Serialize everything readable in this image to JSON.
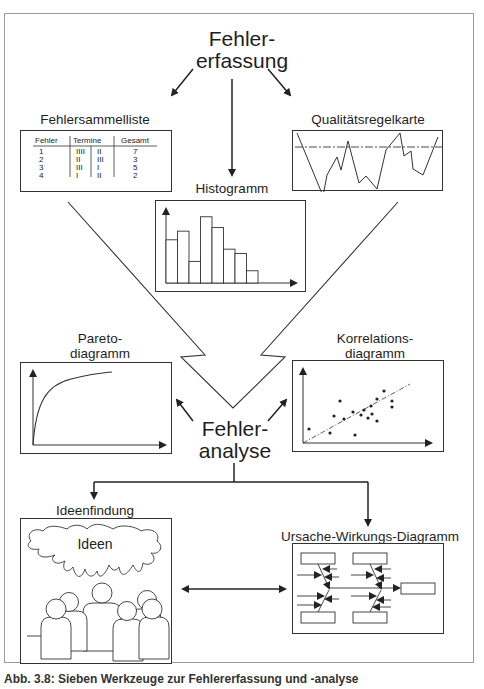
{
  "title": {
    "line1": "Fehler-",
    "line2": "erfassung"
  },
  "center": {
    "line1": "Fehler-",
    "line2": "analyse"
  },
  "tools": {
    "fehlersammelliste": {
      "label": "Fehlersammelliste",
      "headers": [
        "Fehler",
        "Termine",
        "Gesamt"
      ],
      "rows": [
        {
          "fehler": "1",
          "t1": "IIII",
          "t2": "II",
          "gesamt": "7"
        },
        {
          "fehler": "2",
          "t1": "II",
          "t2": "III",
          "gesamt": "3"
        },
        {
          "fehler": "3",
          "t1": "III",
          "t2": "I",
          "gesamt": "5"
        },
        {
          "fehler": "4",
          "t1": "I",
          "t2": "II",
          "gesamt": "2"
        }
      ]
    },
    "qualitaetsregelkarte": {
      "label": "Qualitätsregelkarte"
    },
    "histogramm": {
      "label": "Histogramm",
      "bar_heights_relative": [
        0.6,
        0.72,
        0.3,
        0.92,
        0.77,
        0.47,
        0.41,
        0.17
      ]
    },
    "paretodiagramm": {
      "line1": "Pareto-",
      "line2": "diagramm"
    },
    "korrelationsdiagramm": {
      "line1": "Korrelations-",
      "line2": "diagramm"
    },
    "ideenfindung": {
      "label": "Ideenfindung",
      "cloud_text": "Ideen"
    },
    "ursache_wirkung": {
      "label": "Ursache-Wirkungs-Diagramm"
    }
  },
  "caption": "Abb. 3.8: Sieben Werkzeuge zur Fehlererfassung und -analyse"
}
